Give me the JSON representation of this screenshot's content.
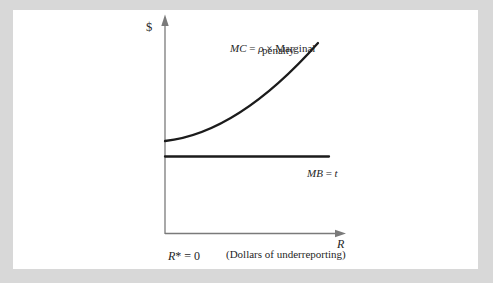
{
  "page": {
    "background_color": "#d8d8d8",
    "panel_color": "#ffffff"
  },
  "colors": {
    "axis": "#7a7a7a",
    "curve": "#1b1b1b",
    "text": "#1f1f1f"
  },
  "labels": {
    "y_axis": "$",
    "x_axis": "R",
    "x_axis_sub": "(Dollars of underreporting)",
    "origin_var": "R",
    "origin_sup": "*",
    "origin_rest": " = 0",
    "mc_var": "MC",
    "mc_eq": " = ",
    "mc_rho": "ρ",
    "mc_times": " × ",
    "mc_word1": "Marginal",
    "mc_word2": "penalty",
    "mb_var": "MB",
    "mb_eq": " = ",
    "mb_value": "t"
  },
  "chart_data": {
    "type": "line",
    "title": "",
    "ylabel": "$",
    "xlabel": "R",
    "x_sublabel": "(Dollars of underreporting)",
    "origin_label": "R* = 0",
    "grid": false,
    "numeric_ticks": false,
    "series": [
      {
        "id": "mc",
        "name": "MC = ρ × Marginal penalty",
        "shape": "convex increasing curve, starts on the vertical axis slightly above the MB line and rises with increasing slope",
        "stroke_width": 2.3,
        "path_px": "M 165 141 Q 238 133 318 43"
      },
      {
        "id": "mb",
        "name": "MB = t",
        "shape": "horizontal line, constant at height t",
        "stroke_width": 2.3,
        "path_px": "M 165 156.5 L 329 156.5"
      }
    ]
  }
}
